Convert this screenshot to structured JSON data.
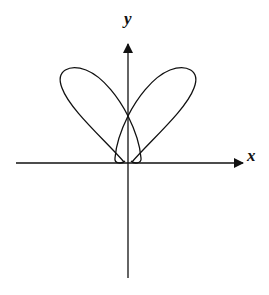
{
  "diagram": {
    "axes": {
      "x_label": "x",
      "y_label": "y"
    },
    "curve": {
      "description": "polar curve with two large lobes in upper quadrants and a small inner loop at the origin",
      "stroke_color": "#111111"
    },
    "colors": {
      "background": "#ffffff",
      "ink": "#111111"
    }
  }
}
